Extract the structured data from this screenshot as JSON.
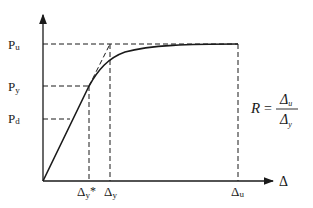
{
  "diagram": {
    "type": "load-displacement curve (ductility definition)",
    "colors": {
      "line": "#1a1a1a",
      "background": "#ffffff"
    },
    "y_axis": {
      "labels": [
        {
          "id": "pu",
          "main": "P",
          "sub": "u"
        },
        {
          "id": "py",
          "main": "P",
          "sub": "y"
        },
        {
          "id": "pd",
          "main": "P",
          "sub": "d"
        }
      ]
    },
    "x_axis": {
      "axis_label": "Δ",
      "labels": [
        {
          "id": "dystar",
          "main": "Δ",
          "sub": "y",
          "suffix": "*"
        },
        {
          "id": "dy",
          "main": "Δ",
          "sub": "y"
        },
        {
          "id": "du",
          "main": "Δ",
          "sub": "u"
        }
      ]
    },
    "formula": {
      "lhs": "R",
      "eq": "=",
      "numerator_main": "Δ",
      "numerator_sub": "u",
      "denominator_main": "Δ",
      "denominator_sub": "y"
    }
  }
}
